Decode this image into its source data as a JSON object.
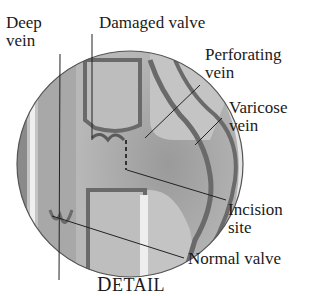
{
  "diagram": {
    "labels": {
      "deep_vein": [
        "Deep",
        "vein"
      ],
      "damaged_valve": "Damaged valve",
      "perforating_vein": [
        "Perforating",
        "vein"
      ],
      "varicose_vein": [
        "Varicose",
        "vein"
      ],
      "incision_site": [
        "Incision",
        "site"
      ],
      "normal_valve": "Normal valve"
    },
    "caption": {
      "first": "D",
      "rest": "ETAIL"
    },
    "colors": {
      "circle_fill": "#c9c9c9",
      "vessel_dark": "#6a6a6a",
      "vessel_mid": "#9c9c9c",
      "highlight": "#eeeeee",
      "leader_line": "#222222"
    }
  }
}
